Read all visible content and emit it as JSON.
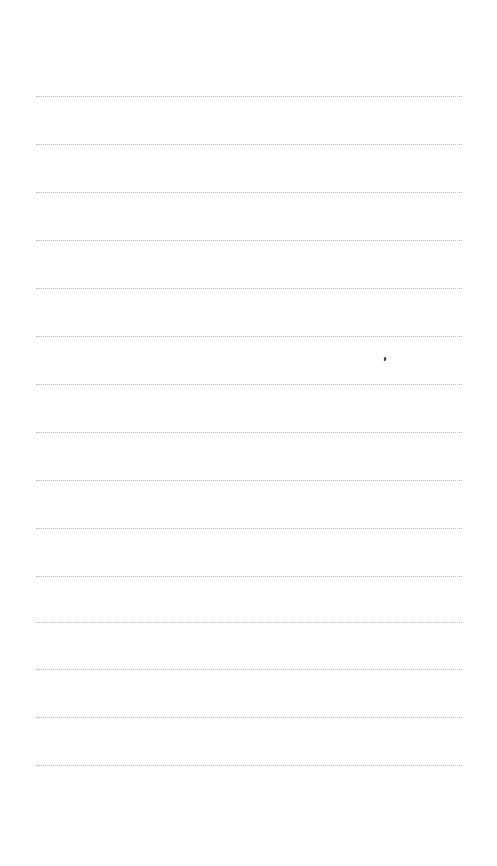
{
  "page": {
    "type": "lined-paper",
    "background": "#ffffff",
    "rule_color": "#bdbdbd",
    "rule_style": "dotted",
    "rule_left": 36,
    "rule_width": 426,
    "rules_y": [
      96,
      144,
      192,
      240,
      288,
      336,
      384,
      432,
      480,
      528,
      576,
      622,
      669,
      717,
      765
    ]
  },
  "marks": [
    {
      "x": 384,
      "y": 357,
      "color": "#333333"
    }
  ]
}
